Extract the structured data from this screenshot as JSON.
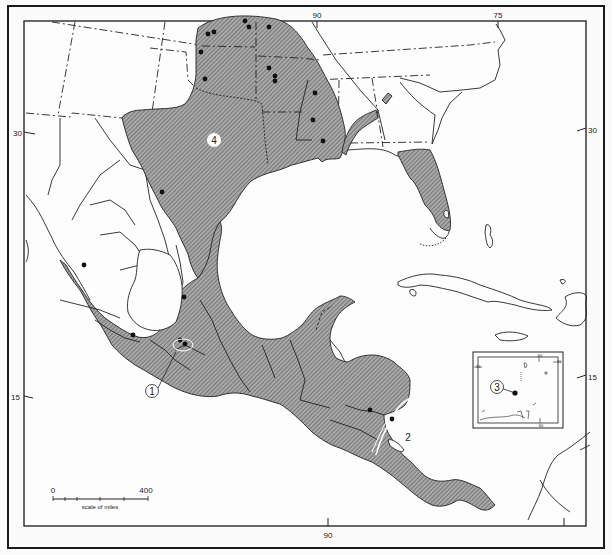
{
  "map": {
    "type": "distribution-map",
    "region": "Southeastern United States, Mexico, Central America and Caribbean",
    "colors": {
      "range_fill": "#9a9a9a",
      "hatch": "#6a6a6a",
      "border": "#1a1a1a",
      "background": "#fbfbfb",
      "dot": "#111111"
    },
    "graticule": {
      "top_ticks": [
        {
          "label": "90"
        },
        {
          "label": "75"
        }
      ],
      "bottom_ticks": [
        {
          "label": "90"
        }
      ],
      "left_ticks": [
        {
          "label": "30"
        },
        {
          "label": "15"
        }
      ],
      "right_ticks": [
        {
          "label": "30"
        },
        {
          "label": "15"
        }
      ]
    },
    "range_labels": [
      {
        "id": "4",
        "label": "4",
        "style": "filled-circle"
      },
      {
        "id": "1",
        "label": "1",
        "style": "outline-circle-with-leader"
      },
      {
        "id": "2",
        "label": "2",
        "style": "filled-circle"
      },
      {
        "id": "3",
        "label": "3",
        "style": "outline-circle-with-leader"
      }
    ],
    "inset": {
      "label": "3",
      "ticks": {
        "top": "60",
        "bottom": "60",
        "left": "15",
        "right": "15"
      }
    },
    "scale_bar": {
      "start_label": "0",
      "end_label": "400",
      "caption": "scale of miles"
    }
  }
}
